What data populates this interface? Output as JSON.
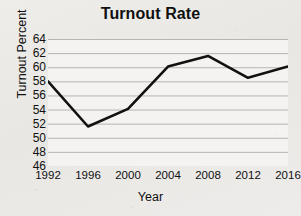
{
  "chart_data": {
    "type": "line",
    "title": "Turnout Rate",
    "xlabel": "Year",
    "ylabel": "Turnout Percent",
    "x": [
      1992,
      1996,
      2000,
      2004,
      2008,
      2012,
      2016
    ],
    "values": [
      58.0,
      51.6,
      54.1,
      60.1,
      61.6,
      58.5,
      60.1
    ],
    "xticklabels": [
      "1992",
      "1996",
      "2000",
      "2004",
      "2008",
      "2012",
      "2016"
    ],
    "yticks": [
      46,
      48,
      50,
      52,
      54,
      56,
      58,
      60,
      62,
      64
    ],
    "yticklabels": [
      "46",
      "48",
      "50",
      "52",
      "54",
      "56",
      "58",
      "60",
      "62",
      "64"
    ],
    "ylim": [
      46,
      64
    ],
    "xlim": [
      1992,
      2016
    ],
    "grid": "horizontal",
    "legend": "none",
    "line_color": "#111111",
    "grid_color": "#b7b5b2",
    "background_color": "#eceae6",
    "plot_background_color": "#f4f3f1"
  }
}
